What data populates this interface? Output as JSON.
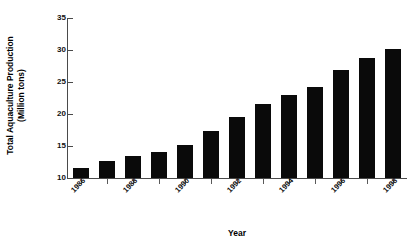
{
  "chart_data": {
    "type": "bar",
    "title": "",
    "xlabel": "Year",
    "ylabel": "Total Aquaculture Production (Million tons)",
    "categories": [
      "1986",
      "1987",
      "1988",
      "1989",
      "1990",
      "1991",
      "1992",
      "1993",
      "1994",
      "1995",
      "1996",
      "1997",
      "1998"
    ],
    "values": [
      11.6,
      12.6,
      13.5,
      14.0,
      15.1,
      17.4,
      19.5,
      21.6,
      23.0,
      24.2,
      26.8,
      28.8,
      30.1
    ],
    "ylim": [
      10,
      35
    ],
    "yticks": [
      10,
      15,
      20,
      25,
      30,
      35
    ],
    "ytick_labels": [
      "10",
      "15",
      "20",
      "25",
      "30",
      "35"
    ],
    "xtick_labels_shown": [
      "1986",
      "1988",
      "1990",
      "1992",
      "1994",
      "1996",
      "1998"
    ],
    "grid": false,
    "legend": "none",
    "bar_color": "#0a0a0a",
    "axis_color": "#4a4a4a",
    "background": "#ffffff"
  },
  "axis_titles": {
    "y_line1": "Total Aquaculture Production",
    "y_line2": "(Million tons)",
    "x": "Year"
  }
}
